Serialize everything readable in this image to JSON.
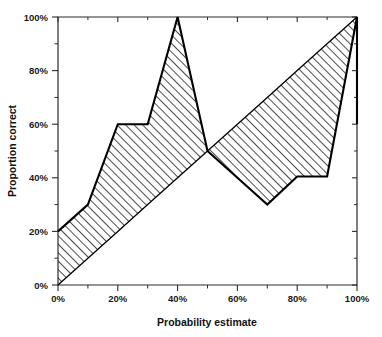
{
  "chart_data": {
    "type": "line",
    "title": "",
    "xlabel": "Probability estimate",
    "ylabel": "Proportion correct",
    "xlim": [
      0,
      100
    ],
    "ylim": [
      0,
      100
    ],
    "grid": false,
    "legend": null,
    "x_tick_labels": [
      "0%",
      "20%",
      "40%",
      "60%",
      "80%",
      "100%"
    ],
    "x_tick_values": [
      0,
      20,
      40,
      60,
      80,
      100
    ],
    "x_minor_tick_values": [
      10,
      30,
      50,
      70,
      90
    ],
    "y_tick_labels": [
      "0%",
      "20%",
      "40%",
      "60%",
      "80%",
      "100%"
    ],
    "y_tick_values": [
      0,
      20,
      40,
      60,
      80,
      100
    ],
    "y_minor_tick_values": [
      10,
      30,
      50,
      70,
      90
    ],
    "x": [
      0,
      10,
      20,
      30,
      40,
      50,
      60,
      70,
      80,
      90,
      100
    ],
    "series": [
      {
        "name": "Calibration curve",
        "values": [
          20,
          30,
          60,
          60,
          100,
          50,
          40,
          30,
          40.5,
          40.5,
          100
        ]
      },
      {
        "name": "Perfect calibration reference",
        "values": [
          0,
          10,
          20,
          30,
          40,
          50,
          60,
          70,
          80,
          90,
          100
        ]
      }
    ],
    "closing_segment": {
      "name": "right-edge closure",
      "from": [
        100,
        100
      ],
      "to": [
        100,
        60
      ]
    },
    "shaded_region": {
      "name": "miscalibration-area",
      "pattern": "diagonal-hatch",
      "description": "Area between the calibration curve and the perfect-calibration diagonal"
    },
    "colors": {
      "line": "#000000",
      "axis": "#2b2b2b",
      "hatch": "#111111",
      "background": "#ffffff"
    }
  },
  "axes": {
    "x_title": "Probability estimate",
    "y_title": "Proportion correct"
  }
}
